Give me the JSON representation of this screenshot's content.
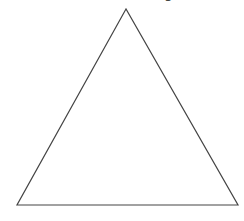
{
  "diagram": {
    "shape": "triangle",
    "stroke_color": "#444444",
    "fill_color": "#ffffff",
    "vertices": {
      "apex": [
        126,
        9
      ],
      "bottom_left": [
        17,
        205
      ],
      "bottom_right": [
        238,
        205
      ]
    },
    "cropped_label_fragment": "g"
  }
}
